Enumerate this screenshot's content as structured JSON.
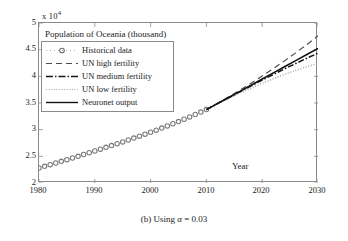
{
  "chart_data": {
    "type": "line",
    "title": "Population of Oceania (thousand)",
    "xlabel": "Year",
    "ylabel": "",
    "y_multiplier": "x 10",
    "y_multiplier_exp": "4",
    "xlim": [
      1980,
      2030
    ],
    "ylim": [
      20000,
      50000
    ],
    "xticks": [
      1980,
      1990,
      2000,
      2010,
      2020,
      2030
    ],
    "xtick_labels": [
      "1980",
      "1990",
      "2000",
      "2010",
      "2020",
      "2030"
    ],
    "yticks": [
      20000,
      25000,
      30000,
      35000,
      40000,
      45000,
      50000
    ],
    "ytick_labels": [
      "2",
      "2.5",
      "3",
      "3.5",
      "4",
      "4.5",
      "5"
    ],
    "grid": false,
    "legend_position": "upper left",
    "series": [
      {
        "name": "Historical data",
        "style": "circle-markers",
        "x": [
          1980,
          1981,
          1982,
          1983,
          1984,
          1985,
          1986,
          1987,
          1988,
          1989,
          1990,
          1991,
          1992,
          1993,
          1994,
          1995,
          1996,
          1997,
          1998,
          1999,
          2000,
          2001,
          2002,
          2003,
          2004,
          2005,
          2006,
          2007,
          2008,
          2009,
          2010
        ],
        "values": [
          22810,
          23120,
          23440,
          23750,
          24060,
          24370,
          24690,
          25010,
          25340,
          25670,
          26000,
          26340,
          26680,
          27020,
          27360,
          27700,
          28060,
          28420,
          28780,
          29150,
          29520,
          29910,
          30300,
          30700,
          31110,
          31520,
          31950,
          32390,
          32840,
          33300,
          33770
        ]
      },
      {
        "name": "UN high fertility",
        "style": "dashed",
        "x": [
          2010,
          2012,
          2014,
          2016,
          2018,
          2020,
          2022,
          2024,
          2026,
          2028,
          2030
        ],
        "values": [
          33770,
          34950,
          36150,
          37400,
          38700,
          40050,
          41450,
          42900,
          44400,
          45950,
          47600
        ]
      },
      {
        "name": "UN medium fertility",
        "style": "dash-dot",
        "x": [
          2010,
          2012,
          2014,
          2016,
          2018,
          2020,
          2022,
          2024,
          2026,
          2028,
          2030
        ],
        "values": [
          33770,
          34880,
          35990,
          37100,
          38200,
          39300,
          40350,
          41400,
          42400,
          43400,
          44350
        ]
      },
      {
        "name": "UN low fertility",
        "style": "dotted",
        "x": [
          2010,
          2012,
          2014,
          2016,
          2018,
          2020,
          2022,
          2024,
          2026,
          2028,
          2030
        ],
        "values": [
          33770,
          34820,
          35850,
          36850,
          37800,
          38700,
          39550,
          40350,
          41100,
          41800,
          42450
        ]
      },
      {
        "name": "Neuronet output",
        "style": "solid",
        "x": [
          2010,
          2012,
          2014,
          2016,
          2018,
          2020,
          2022,
          2024,
          2026,
          2028,
          2030
        ],
        "values": [
          33770,
          34900,
          36030,
          37180,
          38330,
          39500,
          40650,
          41800,
          42950,
          44100,
          45250
        ]
      }
    ]
  },
  "caption": {
    "prefix": "(b) Using ",
    "symbol": "α",
    "equals": " = 0.03"
  },
  "legend": {
    "items": [
      {
        "label": "Historical data",
        "style": "circle-markers"
      },
      {
        "label": "UN high fertility",
        "style": "dashed"
      },
      {
        "label": "UN medium fertility",
        "style": "dash-dot"
      },
      {
        "label": "UN low fertility",
        "style": "dotted"
      },
      {
        "label": "Neuronet output",
        "style": "solid"
      }
    ]
  },
  "colors": {
    "historical": "#7a7a7a",
    "high": "#4d4d4d",
    "medium": "#151515",
    "low": "#9a9a9a",
    "neuronet": "#111111",
    "axis": "#8a8a8a"
  }
}
